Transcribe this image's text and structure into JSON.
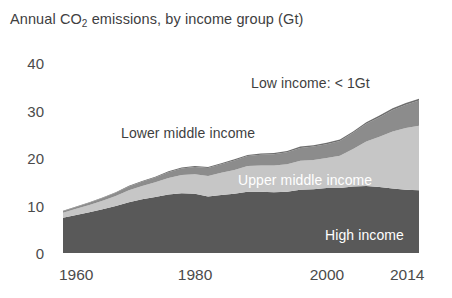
{
  "chart_data": {
    "type": "area",
    "title": "Annual CO2 emissions, by income group (Gt)",
    "title_parts": {
      "before": "Annual CO",
      "sub": "2",
      "after": " emissions, by income group (Gt)"
    },
    "xlabel": "",
    "ylabel": "",
    "xlim": [
      1960,
      2014
    ],
    "ylim": [
      0,
      40
    ],
    "grid": false,
    "legend_position": "inline-annotations",
    "stacked": true,
    "y_ticks": [
      0,
      10,
      20,
      30,
      40
    ],
    "y_tick_labels": [
      "0",
      "10",
      "20",
      "30",
      "40"
    ],
    "x_ticks": [
      1960,
      1980,
      2000,
      2014
    ],
    "x_tick_labels": [
      "1960",
      "1980",
      "2000",
      "2014"
    ],
    "x": [
      1960,
      1962,
      1964,
      1966,
      1968,
      1970,
      1972,
      1974,
      1976,
      1978,
      1980,
      1982,
      1984,
      1986,
      1988,
      1990,
      1992,
      1994,
      1996,
      1998,
      2000,
      2002,
      2004,
      2006,
      2008,
      2010,
      2012,
      2014
    ],
    "series": [
      {
        "name": "High income",
        "color": "#595959",
        "label_color": "#ffffff",
        "values": [
          7.4,
          8.0,
          8.6,
          9.2,
          9.9,
          10.7,
          11.3,
          11.8,
          12.3,
          12.6,
          12.5,
          11.9,
          12.2,
          12.5,
          12.9,
          12.9,
          12.8,
          12.9,
          13.3,
          13.4,
          13.7,
          13.7,
          14.0,
          14.1,
          13.9,
          13.6,
          13.3,
          13.2
        ]
      },
      {
        "name": "Upper middle income",
        "color": "#c6c6c6",
        "label_color": "#ffffff",
        "values": [
          1.1,
          1.3,
          1.5,
          1.8,
          2.1,
          2.5,
          2.8,
          3.1,
          3.5,
          3.8,
          4.1,
          4.3,
          4.7,
          5.0,
          5.4,
          5.5,
          5.6,
          5.8,
          6.1,
          6.2,
          6.3,
          6.8,
          7.9,
          9.4,
          10.6,
          12.0,
          13.0,
          13.6
        ]
      },
      {
        "name": "Lower middle income",
        "color": "#8c8c8c",
        "label_color": "#3f3f3f",
        "values": [
          0.3,
          0.4,
          0.5,
          0.6,
          0.7,
          0.8,
          0.9,
          1.0,
          1.2,
          1.4,
          1.5,
          1.7,
          1.8,
          2.0,
          2.1,
          2.3,
          2.4,
          2.5,
          2.7,
          2.8,
          2.9,
          3.1,
          3.4,
          3.7,
          4.1,
          4.5,
          4.9,
          5.3
        ]
      },
      {
        "name": "Low income",
        "color": "#6e6e6e",
        "label_color": "#3f3f3f",
        "values": [
          0.1,
          0.1,
          0.1,
          0.1,
          0.1,
          0.15,
          0.15,
          0.15,
          0.2,
          0.2,
          0.2,
          0.2,
          0.2,
          0.25,
          0.25,
          0.25,
          0.25,
          0.25,
          0.3,
          0.3,
          0.3,
          0.3,
          0.3,
          0.35,
          0.35,
          0.4,
          0.4,
          0.4
        ]
      }
    ],
    "annotations": [
      {
        "text": "Low income: < 1Gt",
        "style": "dark",
        "left": 251,
        "top": 76
      },
      {
        "text": "Lower middle income",
        "style": "dark",
        "left": 121,
        "top": 126
      },
      {
        "text": "Upper middle income",
        "style": "light",
        "left": 238,
        "top": 173
      },
      {
        "text": "High income",
        "style": "light",
        "left": 325,
        "top": 228
      }
    ]
  }
}
